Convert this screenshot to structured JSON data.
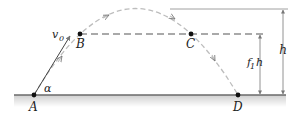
{
  "figure": {
    "points": {
      "A": {
        "label": "A",
        "x": 34,
        "y": 95
      },
      "B": {
        "label": "B",
        "x": 80,
        "y": 34
      },
      "C": {
        "label": "C",
        "x": 191,
        "y": 34
      },
      "D": {
        "label": "D",
        "x": 238,
        "y": 95
      }
    },
    "labels": {
      "velocity": "v",
      "velocity_sub": "0",
      "angle": "α",
      "height": "h",
      "fraction_height": "f",
      "fraction_sub": "1",
      "fraction_suffix": "h"
    },
    "colors": {
      "trajectory": "#b8b8b8",
      "dashed_line": "#555555",
      "ground": "#6a6a6a",
      "ground_shade": "#d9d9d9",
      "points": "#111111",
      "dimension_lines": "#777777",
      "text": "#222222"
    }
  }
}
